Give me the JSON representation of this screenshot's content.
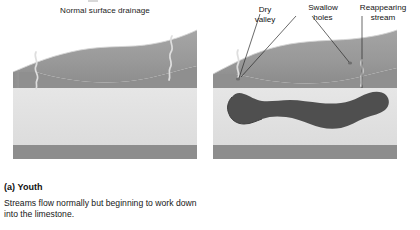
{
  "figure": {
    "kind": "geological-block-diagram-pair",
    "background_color": "#ffffff"
  },
  "panel_a": {
    "title": "Normal surface drainage",
    "caption_label": "(a) Youth",
    "caption_body": "Streams flow normally but beginning to work down into the limestone.",
    "block": {
      "surface_color": "#9b9b9b",
      "surface_shadow_color": "#8a8a8a",
      "front_face_top_band_color": "#8f8f8f",
      "limestone_color": "#e2e2e2",
      "basement_color": "#8d8d8d",
      "stream_color": "#dcdcdc",
      "streams": [
        "left-surface-stream",
        "right-surface-stream"
      ]
    }
  },
  "panel_b": {
    "caption_label": "(b)",
    "callouts": [
      {
        "id": "dry-valley",
        "text": "Dry\nvalley"
      },
      {
        "id": "swallow-holes",
        "text": "Swallow\nholes"
      },
      {
        "id": "reappearing-stream",
        "text": "Reappearing\nstream"
      }
    ],
    "block": {
      "surface_color": "#9b9b9b",
      "surface_shadow_color": "#8a8a8a",
      "front_face_top_band_color": "#8f8f8f",
      "limestone_color": "#e2e2e2",
      "basement_color": "#8d8d8d",
      "cavern_color": "#4a4a4a",
      "stream_color": "#dcdcdc",
      "features": [
        "dry-valley-channel",
        "swallow-hole-left",
        "swallow-hole-right",
        "reappearing-stream-channel",
        "cavern-system"
      ]
    }
  }
}
